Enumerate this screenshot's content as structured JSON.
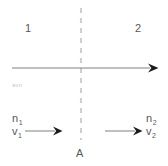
{
  "diagram": {
    "type": "physics-ray-diagram",
    "canvas": {
      "width": 168,
      "height": 166,
      "background": "#ffffff"
    },
    "colors": {
      "ink": "#58585a",
      "axis": "#6f7072",
      "dashed_interface": "#cfcfd1",
      "faint_text": "#c9c9cb",
      "arrowhead": "#1b1b1b"
    },
    "regions": [
      {
        "name": "medium-one",
        "label": "1",
        "side": "left",
        "x": 25,
        "y": 23
      },
      {
        "name": "medium-two",
        "label": "2",
        "side": "right",
        "x": 135,
        "y": 23
      }
    ],
    "interface": {
      "label": "A",
      "style": "dashed",
      "orientation": "vertical",
      "x": 81,
      "y_start": 8,
      "y_end": 140,
      "dash": "5,5",
      "color": "#cfcfd1",
      "label_x": 76,
      "label_y": 148
    },
    "normal_axis": {
      "name": "optical-axis",
      "orientation": "horizontal",
      "y": 68,
      "x_start": 12,
      "x_end": 158,
      "arrow": "right-end",
      "color": "#6f7072"
    },
    "faint_note": {
      "text": "avn",
      "x": 12,
      "y": 82
    },
    "rays": [
      {
        "name": "incident-ray",
        "side": "left",
        "y": 131,
        "x_start": 25,
        "x_end": 62,
        "arrow": "right-end"
      },
      {
        "name": "refracted-ray",
        "side": "right",
        "y": 131,
        "x_start": 105,
        "x_end": 142,
        "arrow": "right-end"
      }
    ],
    "quantities": {
      "left": {
        "name": "medium-one-quantities",
        "x": 12,
        "y": 112,
        "rows": [
          {
            "symbol": "n",
            "subscript": "1"
          },
          {
            "symbol": "v",
            "subscript": "1"
          }
        ]
      },
      "right": {
        "name": "medium-two-quantities",
        "x": 146,
        "y": 112,
        "rows": [
          {
            "symbol": "n",
            "subscript": "2"
          },
          {
            "symbol": "v",
            "subscript": "2"
          }
        ]
      }
    }
  }
}
